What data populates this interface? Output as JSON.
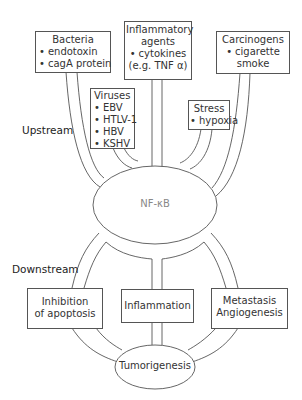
{
  "diagram": {
    "section_labels": {
      "upstream": "Upstream",
      "downstream": "Downstream"
    },
    "upstream_boxes": [
      {
        "title": "Bacteria",
        "items": [
          "endotoxin",
          "cagA protein"
        ]
      },
      {
        "title_lines": [
          "Inflammatory",
          "agents"
        ],
        "items": [
          "cytokines"
        ],
        "note": "(e.g. TNF α)"
      },
      {
        "title": "Carcinogens",
        "items": [
          "cigarette"
        ],
        "note": "smoke"
      },
      {
        "title": "Viruses",
        "items": [
          "EBV",
          "HTLV-1",
          "HBV",
          "KSHV"
        ]
      },
      {
        "title": "Stress",
        "items": [
          "hypoxia"
        ]
      }
    ],
    "central_node": "NF-κB",
    "downstream_boxes": [
      {
        "lines": [
          "Inhibition",
          "of apoptosis"
        ]
      },
      {
        "lines": [
          "Inflammation"
        ]
      },
      {
        "lines": [
          "Metastasis",
          "Angiogenesis"
        ]
      }
    ],
    "outcome_node": "Tumorigenesis",
    "colors": {
      "stroke": "#555555",
      "text": "#333333",
      "central_text": "#888888",
      "background": "#ffffff"
    }
  }
}
